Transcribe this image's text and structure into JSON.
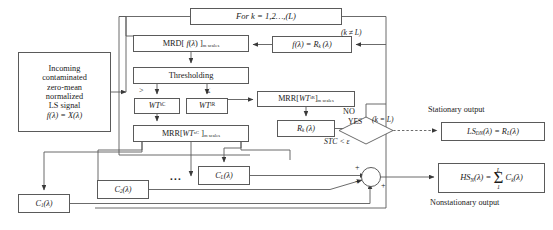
{
  "diagram": {
    "nodes": {
      "for_loop": "For k = 1,2…,(L)",
      "input_line1": "Incoming",
      "input_line2": "contaminated",
      "input_line3": "zero-mean",
      "input_line4": "normalized",
      "input_line5": "LS signal",
      "input_line6": "f(λ) = X(λ)",
      "mrd": "MRD[ f(λ) ]m scales",
      "thresholding": "Thresholding",
      "wt_sc": "WT sC",
      "wt_ir": "WT iR",
      "mrr_ir": "MRR[ WT iR ]m scales",
      "mrr_sc": "MRR[ WT sC ]m scales",
      "rk": "Rk(λ)",
      "f_eq_rk": "f(λ) = Rk(λ)",
      "decision": "STC < ε",
      "ls_dn": "LSDN(λ) = RL(λ)",
      "hs_n": "HSN(λ) = Σ Ck(λ)",
      "c1": "C1(λ)",
      "c2": "C2(λ)",
      "cL": "CL(λ)"
    },
    "edge_labels": {
      "k_not_equal_L": "(k ≠ L)",
      "k_equal_L": "(k = L)",
      "no": "NO",
      "yes": "YES",
      "greater_than": ">",
      "less_equal": "≤",
      "ellipsis": "...",
      "plus_top": "+",
      "plus_middle": "+",
      "plus_bottom": "+"
    },
    "annotations": {
      "stationary_output": "Stationary output",
      "nonstationary_output": "Nonstationary output"
    },
    "colors": {
      "stroke": "#5a5a5a",
      "text": "#1a1a1a",
      "background": "#ffffff"
    }
  }
}
